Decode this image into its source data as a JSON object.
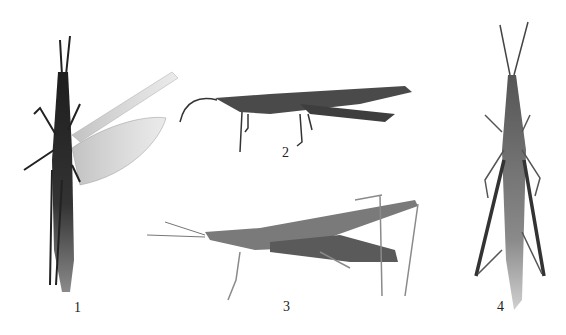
{
  "figure": {
    "type": "specimen-plate",
    "background": "#ffffff",
    "panels": [
      {
        "label": "1",
        "view": "dorsal, wings spread"
      },
      {
        "label": "2",
        "view": "lateral"
      },
      {
        "label": "3",
        "view": "lateral"
      },
      {
        "label": "4",
        "view": "dorsal"
      }
    ]
  },
  "colors": {
    "dark_body": "#2a2a2a",
    "mid_body": "#6a6a6a",
    "light_body": "#9a9a9a",
    "wing": "#c8c8c8"
  }
}
